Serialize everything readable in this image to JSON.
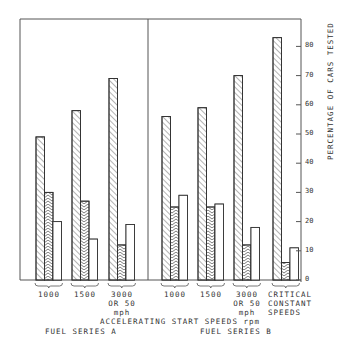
{
  "chart_data": {
    "type": "bar",
    "title": "",
    "xlabel": "ACCELERATING START SPEEDS rpm",
    "ylabel": "PERCENTAGE OF CARS TESTED",
    "ylim": [
      0,
      90
    ],
    "yticks": [
      0,
      10,
      20,
      30,
      40,
      50,
      60,
      70,
      80
    ],
    "grid": false,
    "legend": "none",
    "panels": [
      {
        "name": "FUEL SERIES A",
        "categories": [
          "1000",
          "1500",
          "3000 OR 50 mph"
        ],
        "series": [
          {
            "name": "right-hatched",
            "values": [
              49,
              58,
              69
            ]
          },
          {
            "name": "chevron-hatched",
            "values": [
              30,
              27,
              12
            ]
          },
          {
            "name": "open",
            "values": [
              20,
              14,
              19
            ]
          }
        ]
      },
      {
        "name": "FUEL SERIES B",
        "categories": [
          "1000",
          "1500",
          "3000 OR 50 mph",
          "CRITICAL CONSTANT SPEEDS"
        ],
        "series": [
          {
            "name": "right-hatched",
            "values": [
              56,
              59,
              70,
              83
            ]
          },
          {
            "name": "chevron-hatched",
            "values": [
              25,
              25,
              12,
              6
            ]
          },
          {
            "name": "open",
            "values": [
              29,
              26,
              18,
              11
            ]
          }
        ]
      }
    ]
  },
  "labels": {
    "cat_a1": "1000",
    "cat_a2": "1500",
    "cat_a3": "3000\nOR 50\nmph",
    "cat_b1": "1000",
    "cat_b2": "1500",
    "cat_b3": "3000\nOR 50\nmph",
    "cat_b4": "CRITICAL\nCONSTANT\nSPEEDS",
    "xlabel": "ACCELERATING START SPEEDS rpm",
    "series_a": "FUEL SERIES A",
    "series_b": "FUEL SERIES B",
    "ylabel": "PERCENTAGE OF CARS TESTED"
  }
}
